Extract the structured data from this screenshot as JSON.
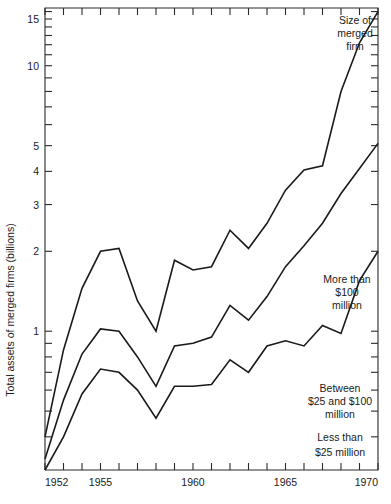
{
  "chart_data": {
    "type": "line",
    "title": "",
    "xlabel": "",
    "ylabel": "Total assets of merged firms (billions)",
    "xlim": [
      1952,
      1970
    ],
    "ylim": [
      0.3,
      16.5
    ],
    "yscale": "log",
    "grid": false,
    "legend": "inline-annotations",
    "x": [
      1952,
      1953,
      1954,
      1955,
      1956,
      1957,
      1958,
      1959,
      1960,
      1961,
      1962,
      1963,
      1964,
      1965,
      1966,
      1967,
      1968,
      1969,
      1970
    ],
    "yticks_labeled": [
      1,
      2,
      3,
      4,
      5,
      10,
      15
    ],
    "xticks_labeled": [
      1952,
      1955,
      1960,
      1965,
      1970
    ],
    "series": [
      {
        "name": "Size of merged firm",
        "annotation": [
          "Size of",
          "merged",
          "firm"
        ],
        "values": [
          0.4,
          0.85,
          1.45,
          2.0,
          2.05,
          1.3,
          1.0,
          1.85,
          1.7,
          1.75,
          2.4,
          2.05,
          2.55,
          3.4,
          4.05,
          4.2,
          8.0,
          12.2,
          16.0
        ]
      },
      {
        "name": "More than $100 million",
        "annotation": [
          "More than",
          "$100",
          "million"
        ],
        "values": [
          0.33,
          0.55,
          0.82,
          1.02,
          1.0,
          0.8,
          0.62,
          0.88,
          0.9,
          0.95,
          1.25,
          1.1,
          1.35,
          1.75,
          2.1,
          2.55,
          3.3,
          4.1,
          5.1
        ]
      },
      {
        "name": "Between $25 and $100 million",
        "annotation": [
          "Between",
          "$25 and $100",
          "million"
        ],
        "values": [
          0.3,
          0.4,
          0.58,
          0.72,
          0.7,
          0.6,
          0.47,
          0.62,
          0.62,
          0.63,
          0.78,
          0.7,
          0.88,
          0.92,
          0.88,
          1.05,
          0.98,
          1.55,
          2.0
        ]
      }
    ],
    "annotations": [
      {
        "id": "less-than-25",
        "lines": [
          "Less than",
          "$25 million"
        ]
      }
    ]
  }
}
